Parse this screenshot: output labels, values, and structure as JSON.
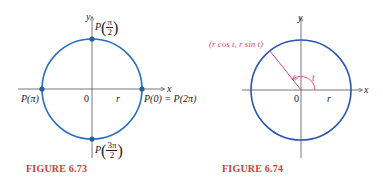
{
  "figures": [
    {
      "caption": "FIGURE 6.73",
      "axis_x": "x",
      "axis_y": "y",
      "origin": "0",
      "radius_label": "r",
      "points": {
        "top": {
          "prefix": "P",
          "num": "π",
          "den": "2"
        },
        "left": "P(π)",
        "right": "P(0) = P(2π)",
        "bottom": {
          "prefix": "P",
          "num": "3π",
          "den": "2"
        }
      },
      "colors": {
        "circle": "#2a6fc0",
        "dot": "#1f5fa8",
        "axis": "#555555"
      }
    },
    {
      "caption": "FIGURE 6.74",
      "axis_x": "x",
      "axis_y": "y",
      "origin": "0",
      "radius_label": "r",
      "point_label": "(r cos t, r sin t)",
      "angle_label": "t",
      "colors": {
        "circle": "#2a55b0",
        "radius_line": "#d6457e",
        "caption": "#d8393b"
      }
    }
  ]
}
